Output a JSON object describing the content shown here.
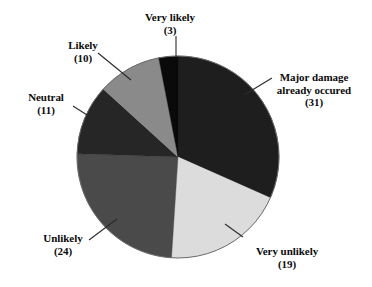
{
  "chart_data": {
    "type": "pie",
    "title": "",
    "subtitle": "",
    "xlabel": "",
    "ylabel": "",
    "legend_position": "none",
    "grid": false,
    "label_format": "name + (count)",
    "total": 98,
    "start_angle_deg": 0,
    "direction": "clockwise",
    "categories": [
      "Major damage already occured",
      "Very unlikely",
      "Unlikely",
      "Neutral",
      "Likely",
      "Very likely"
    ],
    "values": [
      31,
      19,
      24,
      11,
      10,
      3
    ],
    "slices": [
      {
        "name": "Major damage already occured",
        "label_lines": [
          "Major damage",
          "already occured",
          "(31)"
        ],
        "value": 31,
        "count_text": "(31)",
        "color": "#1e1e1e",
        "start_deg": 0.0,
        "sweep_deg": 113.88
      },
      {
        "name": "Very unlikely",
        "label_lines": [
          "Very unlikely",
          "(19)"
        ],
        "value": 19,
        "count_text": "(19)",
        "color": "#dcdcdc",
        "start_deg": 113.88,
        "sweep_deg": 69.8
      },
      {
        "name": "Unlikely",
        "label_lines": [
          "Unlikely",
          "(24)"
        ],
        "value": 24,
        "count_text": "(24)",
        "color": "#4a4a4a",
        "start_deg": 183.68,
        "sweep_deg": 88.16
      },
      {
        "name": "Neutral",
        "label_lines": [
          "Neutral",
          "(11)"
        ],
        "value": 11,
        "count_text": "(11)",
        "color": "#262626",
        "start_deg": 271.84,
        "sweep_deg": 40.41
      },
      {
        "name": "Likely",
        "label_lines": [
          "Likely",
          "(10)"
        ],
        "value": 10,
        "count_text": "(10)",
        "color": "#8a8a8a",
        "start_deg": 312.25,
        "sweep_deg": 36.73
      },
      {
        "name": "Very likely",
        "label_lines": [
          "Very likely",
          "(3)"
        ],
        "value": 3,
        "count_text": "(3)",
        "color": "#0a0a0a",
        "start_deg": 348.98,
        "sweep_deg": 11.02
      }
    ]
  },
  "labels": {
    "very_likely": {
      "line1": "Very likely",
      "line2": "(3)"
    },
    "major_damage": {
      "line1": "Major damage",
      "line2": "already occured",
      "line3": "(31)"
    },
    "likely": {
      "line1": "Likely",
      "line2": "(10)"
    },
    "neutral": {
      "line1": "Neutral",
      "line2": "(11)"
    },
    "unlikely": {
      "line1": "Unlikely",
      "line2": "(24)"
    },
    "very_unlikely": {
      "line1": "Very unlikely",
      "line2": "(19)"
    }
  },
  "style": {
    "background": "#ffffff",
    "text_color": "#0b0b0b",
    "outline_color": "#6b6b6b",
    "leader_color": "#2a2a2a"
  }
}
